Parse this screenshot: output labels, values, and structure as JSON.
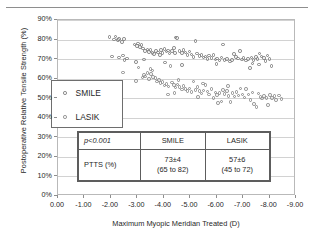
{
  "figure": {
    "name": "scatter-plot-ptts-vs-myopic-meridian"
  },
  "chart_data": {
    "type": "scatter",
    "title": "",
    "xlabel": "Maximum Myopic Meridian Treated (D)",
    "ylabel": "Postoperative Relative Tensile Strength (%)",
    "xlim": [
      0,
      -9
    ],
    "ylim": [
      0,
      90
    ],
    "xticks": [
      "0.00",
      "-1.00",
      "-2.00",
      "-3.00",
      "-4.00",
      "-5.00",
      "-6.00",
      "-7.00",
      "-8.00",
      "-9.00"
    ],
    "xtick_values": [
      0,
      -1,
      -2,
      -3,
      -4,
      -5,
      -6,
      -7,
      -8,
      -9
    ],
    "yticks": [
      "0%",
      "10%",
      "20%",
      "30%",
      "40%",
      "50%",
      "60%",
      "70%",
      "80%",
      "90%"
    ],
    "ytick_values": [
      0,
      10,
      20,
      30,
      40,
      50,
      60,
      70,
      80,
      90
    ],
    "grid": true,
    "legend_position": "center-left",
    "series": [
      {
        "name": "SMILE",
        "marker": "open-circle",
        "color": "#7c7c7c",
        "points": [
          [
            -1.95,
            81.2
          ],
          [
            -2.12,
            80.0
          ],
          [
            -2.18,
            81.5
          ],
          [
            -2.28,
            79.8
          ],
          [
            -2.3,
            80.4
          ],
          [
            -2.42,
            78.6
          ],
          [
            -2.5,
            80.3
          ],
          [
            -2.05,
            71.4
          ],
          [
            -2.3,
            70.8
          ],
          [
            -2.45,
            71.8
          ],
          [
            -2.6,
            70.3
          ],
          [
            -2.52,
            69.6
          ],
          [
            -2.9,
            77.5
          ],
          [
            -2.98,
            76.8
          ],
          [
            -3.02,
            77.9
          ],
          [
            -3.1,
            76.2
          ],
          [
            -3.15,
            77.2
          ],
          [
            -3.22,
            75.4
          ],
          [
            -3.3,
            74.2
          ],
          [
            -3.38,
            75.0
          ],
          [
            -3.45,
            73.6
          ],
          [
            -3.5,
            74.8
          ],
          [
            -3.58,
            73.2
          ],
          [
            -3.62,
            72.6
          ],
          [
            -3.7,
            74.0
          ],
          [
            -3.78,
            73.4
          ],
          [
            -3.85,
            72.2
          ],
          [
            -3.9,
            74.6
          ],
          [
            -3.95,
            73.0
          ],
          [
            -4.02,
            75.2
          ],
          [
            -4.1,
            73.8
          ],
          [
            -4.15,
            74.4
          ],
          [
            -4.22,
            72.8
          ],
          [
            -4.3,
            74.0
          ],
          [
            -4.38,
            75.6
          ],
          [
            -4.42,
            73.2
          ],
          [
            -4.5,
            80.8
          ],
          [
            -4.45,
            81.0
          ],
          [
            -4.6,
            74.2
          ],
          [
            -4.68,
            73.0
          ],
          [
            -4.75,
            74.6
          ],
          [
            -4.82,
            73.4
          ],
          [
            -4.9,
            72.0
          ],
          [
            -4.98,
            73.8
          ],
          [
            -5.05,
            72.4
          ],
          [
            -5.12,
            71.2
          ],
          [
            -5.2,
            79.2
          ],
          [
            -5.25,
            72.8
          ],
          [
            -5.35,
            71.6
          ],
          [
            -5.42,
            72.2
          ],
          [
            -5.5,
            70.8
          ],
          [
            -5.58,
            71.4
          ],
          [
            -5.65,
            70.2
          ],
          [
            -5.72,
            71.8
          ],
          [
            -5.8,
            70.6
          ],
          [
            -5.88,
            72.0
          ],
          [
            -5.95,
            69.8
          ],
          [
            -6.02,
            70.4
          ],
          [
            -6.1,
            69.2
          ],
          [
            -6.18,
            70.8
          ],
          [
            -6.25,
            77.4
          ],
          [
            -6.3,
            69.6
          ],
          [
            -6.4,
            70.2
          ],
          [
            -6.5,
            68.8
          ],
          [
            -6.58,
            69.4
          ],
          [
            -6.65,
            72.6
          ],
          [
            -6.72,
            71.0
          ],
          [
            -6.8,
            70.4
          ],
          [
            -6.88,
            74.2
          ],
          [
            -6.95,
            69.8
          ],
          [
            -7.02,
            70.6
          ],
          [
            -7.1,
            69.2
          ],
          [
            -7.18,
            70.0
          ],
          [
            -7.25,
            65.4
          ],
          [
            -7.32,
            70.8
          ],
          [
            -7.4,
            69.4
          ],
          [
            -7.48,
            71.2
          ],
          [
            -7.55,
            70.2
          ],
          [
            -7.62,
            72.8
          ],
          [
            -7.7,
            71.4
          ],
          [
            -7.78,
            70.6
          ],
          [
            -7.85,
            69.0
          ],
          [
            -7.92,
            71.8
          ],
          [
            -8.0,
            70.0
          ],
          [
            -8.08,
            66.4
          ],
          [
            -7.6,
            67.2
          ],
          [
            -7.35,
            67.8
          ],
          [
            -6.0,
            67.4
          ],
          [
            -4.7,
            67.0
          ],
          [
            -4.05,
            68.2
          ],
          [
            -3.25,
            69.8
          ],
          [
            -2.95,
            68.4
          ]
        ]
      },
      {
        "name": "LASIK",
        "marker": "open-circle",
        "color": "#8a8a8a",
        "points": [
          [
            -2.45,
            63.2
          ],
          [
            -2.95,
            58.8
          ],
          [
            -3.05,
            65.8
          ],
          [
            -3.2,
            60.6
          ],
          [
            -3.25,
            62.0
          ],
          [
            -3.3,
            61.2
          ],
          [
            -3.38,
            63.0
          ],
          [
            -3.45,
            59.8
          ],
          [
            -3.52,
            62.4
          ],
          [
            -3.6,
            61.0
          ],
          [
            -3.68,
            60.2
          ],
          [
            -3.75,
            58.6
          ],
          [
            -3.82,
            59.4
          ],
          [
            -3.88,
            57.8
          ],
          [
            -3.95,
            58.2
          ],
          [
            -4.02,
            56.6
          ],
          [
            -4.1,
            57.4
          ],
          [
            -4.18,
            56.0
          ],
          [
            -4.25,
            66.6
          ],
          [
            -4.3,
            58.0
          ],
          [
            -4.38,
            56.8
          ],
          [
            -4.45,
            55.4
          ],
          [
            -4.52,
            57.0
          ],
          [
            -4.6,
            55.8
          ],
          [
            -4.68,
            54.4
          ],
          [
            -4.75,
            56.2
          ],
          [
            -4.82,
            54.8
          ],
          [
            -4.9,
            53.6
          ],
          [
            -4.98,
            55.0
          ],
          [
            -5.05,
            53.2
          ],
          [
            -5.12,
            58.6
          ],
          [
            -5.2,
            54.2
          ],
          [
            -5.28,
            55.6
          ],
          [
            -5.35,
            53.8
          ],
          [
            -5.42,
            52.4
          ],
          [
            -5.5,
            54.0
          ],
          [
            -5.58,
            56.8
          ],
          [
            -5.65,
            53.4
          ],
          [
            -5.72,
            52.0
          ],
          [
            -5.8,
            54.6
          ],
          [
            -5.88,
            50.2
          ],
          [
            -5.95,
            53.0
          ],
          [
            -6.02,
            51.6
          ],
          [
            -6.1,
            52.8
          ],
          [
            -6.18,
            48.4
          ],
          [
            -6.25,
            54.2
          ],
          [
            -6.3,
            52.2
          ],
          [
            -6.38,
            53.6
          ],
          [
            -6.45,
            51.0
          ],
          [
            -6.52,
            48.0
          ],
          [
            -6.6,
            52.6
          ],
          [
            -6.68,
            50.8
          ],
          [
            -6.75,
            53.2
          ],
          [
            -6.82,
            51.4
          ],
          [
            -6.9,
            55.0
          ],
          [
            -6.98,
            52.0
          ],
          [
            -7.05,
            50.4
          ],
          [
            -7.12,
            54.8
          ],
          [
            -7.2,
            51.8
          ],
          [
            -7.28,
            49.2
          ],
          [
            -7.35,
            53.0
          ],
          [
            -7.42,
            47.0
          ],
          [
            -7.5,
            45.6
          ],
          [
            -7.58,
            52.4
          ],
          [
            -7.65,
            50.6
          ],
          [
            -7.72,
            49.8
          ],
          [
            -7.8,
            51.2
          ],
          [
            -7.88,
            50.0
          ],
          [
            -7.95,
            46.4
          ],
          [
            -8.02,
            51.6
          ],
          [
            -8.1,
            50.2
          ],
          [
            -8.18,
            51.0
          ],
          [
            -8.25,
            49.0
          ],
          [
            -8.35,
            51.4
          ],
          [
            -8.45,
            49.6
          ],
          [
            -6.05,
            47.6
          ],
          [
            -5.3,
            50.6
          ],
          [
            -4.4,
            52.6
          ],
          [
            -4.15,
            52.0
          ],
          [
            -3.5,
            65.0
          ],
          [
            -3.58,
            64.2
          ],
          [
            -4.55,
            59.2
          ],
          [
            -5.48,
            57.6
          ],
          [
            -6.42,
            56.2
          ]
        ]
      }
    ]
  },
  "legend": {
    "items": [
      {
        "label": "SMILE",
        "marker": "open-circle"
      },
      {
        "label": "LASIK",
        "marker": "open-circle"
      }
    ]
  },
  "stats_table": {
    "header": {
      "corner": "p<0.001",
      "columns": [
        "SMILE",
        "LASIK"
      ]
    },
    "rows": [
      {
        "label": "PTTS (%)",
        "cells": [
          {
            "main": "73±4",
            "range": "(65 to 82)"
          },
          {
            "main": "57±6",
            "range": "(45 to 72)"
          }
        ]
      }
    ]
  }
}
